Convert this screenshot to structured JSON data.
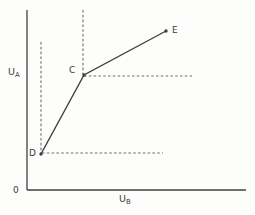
{
  "figure": {
    "background_color": "#fdfdfc",
    "solid_line_color": "#404040",
    "dashed_line_color": "#6f6f6f",
    "text_color": "#3b3b3b",
    "origin_label": "0",
    "y_axis_label": {
      "base": "U",
      "sub": "A"
    },
    "x_axis_label": {
      "base": "U",
      "sub": "B"
    },
    "geometry": {
      "y_axis": {
        "x1": 27,
        "y1": 10,
        "x2": 27,
        "y2": 190
      },
      "x_axis": {
        "x1": 27,
        "y1": 190,
        "x2": 246,
        "y2": 190
      },
      "curve_points": [
        [
          41,
          154
        ],
        [
          84,
          75
        ],
        [
          166,
          31
        ]
      ],
      "dashed_guides": [
        {
          "name": "guide-vertical-through-D",
          "x1": 41,
          "y1": 42,
          "x2": 41,
          "y2": 154
        },
        {
          "name": "guide-vertical-through-C",
          "x1": 83,
          "y1": 10,
          "x2": 83,
          "y2": 75
        },
        {
          "name": "guide-horizontal-through-C",
          "x1": 84,
          "y1": 76,
          "x2": 192,
          "y2": 76
        },
        {
          "name": "guide-horizontal-through-D",
          "x1": 42,
          "y1": 153,
          "x2": 163,
          "y2": 153
        }
      ],
      "label_positions": {
        "origin": {
          "x": 13,
          "y": 186
        },
        "y_axis": {
          "x": 8,
          "y": 67
        },
        "x_axis": {
          "x": 119,
          "y": 194
        }
      }
    },
    "points": [
      {
        "label": "D",
        "x": 41,
        "y": 154,
        "label_x": 29,
        "label_y": 149
      },
      {
        "label": "C",
        "x": 84,
        "y": 75,
        "label_x": 69,
        "label_y": 66
      },
      {
        "label": "E",
        "x": 166,
        "y": 31,
        "label_x": 172,
        "label_y": 26
      }
    ]
  }
}
